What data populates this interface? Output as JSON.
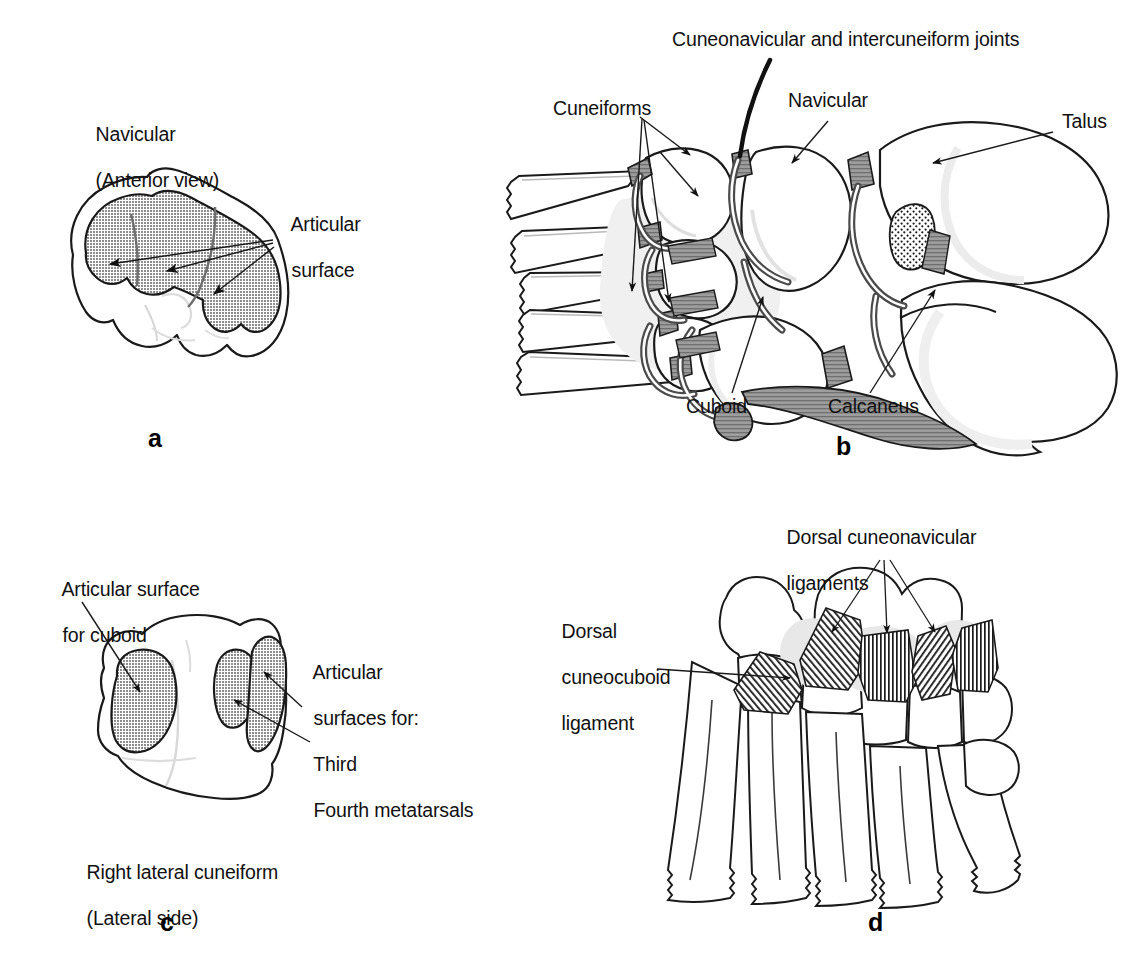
{
  "figure": {
    "kind": "anatomical-illustration",
    "background_color": "#ffffff",
    "line_color": "#1a1a1a",
    "shading_color": "#a9a9a9",
    "cartilage_color": "#8f8f8f"
  },
  "panels": [
    {
      "id": "a",
      "letter": "a",
      "title_lines": [
        "Navicular",
        "(Anterior view)"
      ],
      "labels": [
        {
          "name": "articular-surface",
          "lines": [
            "Articular",
            "surface"
          ],
          "arrows": 3
        }
      ]
    },
    {
      "id": "b",
      "letter": "b",
      "labels": [
        {
          "name": "cuneonavicular-intercuneiform-joints",
          "lines": [
            "Cuneonavicular and intercuneiform joints"
          ]
        },
        {
          "name": "cuneiforms",
          "lines": [
            "Cuneiforms"
          ]
        },
        {
          "name": "navicular",
          "lines": [
            "Navicular"
          ]
        },
        {
          "name": "talus",
          "lines": [
            "Talus"
          ]
        },
        {
          "name": "cuboid",
          "lines": [
            "Cuboid"
          ]
        },
        {
          "name": "calcaneus",
          "lines": [
            "Calcaneus"
          ]
        }
      ]
    },
    {
      "id": "c",
      "letter": "c",
      "title_lines": [
        "Right lateral cuneiform",
        "(Lateral side)"
      ],
      "labels": [
        {
          "name": "articular-surface-for-cuboid",
          "lines": [
            "Articular surface",
            "for cuboid"
          ]
        },
        {
          "name": "articular-surfaces-for-metatarsals",
          "lines": [
            "Articular",
            "surfaces for:",
            "Third",
            "Fourth metatarsals"
          ]
        }
      ]
    },
    {
      "id": "d",
      "letter": "d",
      "labels": [
        {
          "name": "dorsal-cuneonavicular-ligaments",
          "lines": [
            "Dorsal cuneonavicular",
            "ligaments"
          ]
        },
        {
          "name": "dorsal-cuneocuboid-ligament",
          "lines": [
            "Dorsal",
            "cuneocuboid",
            "ligament"
          ]
        }
      ]
    }
  ],
  "text": {
    "a_title_1": "Navicular",
    "a_title_2": "(Anterior view)",
    "a_articular_1": "Articular",
    "a_articular_2": "surface",
    "a_letter": "a",
    "b_joints": "Cuneonavicular and intercuneiform joints",
    "b_cuneiforms": "Cuneiforms",
    "b_navicular": "Navicular",
    "b_talus": "Talus",
    "b_cuboid": "Cuboid",
    "b_calcaneus": "Calcaneus",
    "b_letter": "b",
    "c_art_cuboid_1": "Articular surface",
    "c_art_cuboid_2": "for cuboid",
    "c_art_mt_1": "Articular",
    "c_art_mt_2": "surfaces for:",
    "c_art_mt_3": "Third",
    "c_art_mt_4": "Fourth metatarsals",
    "c_title_1": "Right lateral cuneiform",
    "c_title_2": "(Lateral side)",
    "c_letter": "c",
    "d_cuneonav_1": "Dorsal cuneonavicular",
    "d_cuneonav_2": "ligaments",
    "d_cuneocub_1": "Dorsal",
    "d_cuneocub_2": "cuneocuboid",
    "d_cuneocub_3": "ligament",
    "d_letter": "d"
  }
}
